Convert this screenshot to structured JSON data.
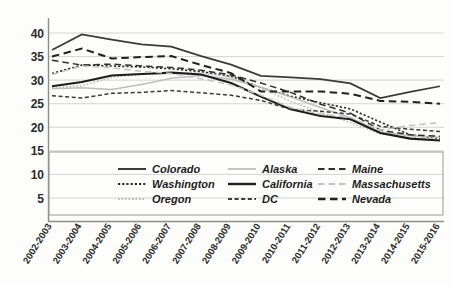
{
  "chart_data": {
    "type": "line",
    "title": "",
    "xlabel": "",
    "ylabel": "",
    "ylim": [
      0,
      42
    ],
    "yticks": [
      5,
      10,
      15,
      20,
      25,
      30,
      35,
      40
    ],
    "grid": true,
    "legend_position": "bottom-inside",
    "categories": [
      "2002-2003",
      "2003-2004",
      "2004-2005",
      "2005-2006",
      "2006-2007",
      "2007-2008",
      "2008-2009",
      "2009-2010",
      "2010-2011",
      "2011-2012",
      "2012-2013",
      "2013-2014",
      "2014-2015",
      "2015-2016"
    ],
    "series": [
      {
        "name": "Colorado",
        "style": "solid",
        "color": "#3a3a3a",
        "width": 1.7,
        "values": [
          36.4,
          39.7,
          38.6,
          37.6,
          37.1,
          35.1,
          33.3,
          30.9,
          30.6,
          30.2,
          29.3,
          26.2,
          27.5,
          28.7
        ]
      },
      {
        "name": "Washington",
        "style": "dotted",
        "color": "#2b2b2b",
        "width": 1.6,
        "values": [
          31.4,
          33.2,
          33.0,
          32.8,
          32.4,
          31.8,
          30.8,
          28.4,
          26.6,
          25.2,
          23.9,
          21.1,
          18.4,
          17.6
        ]
      },
      {
        "name": "Oregon",
        "style": "fine-dotted",
        "color": "#b9b9b9",
        "width": 1.5,
        "values": [
          28.4,
          28.8,
          30.6,
          31.2,
          31.4,
          31.6,
          30.6,
          28.3,
          25.5,
          23.1,
          21.0,
          18.6,
          17.8,
          17.4
        ]
      },
      {
        "name": "Alaska",
        "style": "solid",
        "color": "#bdbdbd",
        "width": 1.5,
        "values": [
          28.2,
          28.4,
          28.0,
          29.1,
          30.4,
          31.0,
          30.2,
          28.5,
          26.4,
          24.2,
          22.0,
          19.0,
          18.2,
          17.9
        ]
      },
      {
        "name": "California",
        "style": "solid",
        "color": "#1c1c1c",
        "width": 2.1,
        "values": [
          28.7,
          29.6,
          31.0,
          31.3,
          31.6,
          31.2,
          29.4,
          26.5,
          23.8,
          22.4,
          21.7,
          18.8,
          17.6,
          17.2
        ]
      },
      {
        "name": "DC",
        "style": "dashed-short",
        "color": "#3a3a3a",
        "width": 1.5,
        "values": [
          26.7,
          26.2,
          27.2,
          27.4,
          27.8,
          27.3,
          26.8,
          25.7,
          23.8,
          23.4,
          22.8,
          20.2,
          19.6,
          19.1
        ]
      },
      {
        "name": "Maine",
        "style": "dashed-long",
        "color": "#2f2f2f",
        "width": 1.5,
        "values": [
          34.2,
          33.2,
          33.4,
          33.0,
          32.7,
          32.1,
          31.1,
          29.4,
          27.4,
          24.9,
          23.0,
          19.4,
          18.4,
          18.1
        ]
      },
      {
        "name": "Massachusetts",
        "style": "dashed-long",
        "color": "#c2c2c2",
        "width": 1.5,
        "values": [
          31.2,
          33.0,
          32.6,
          31.9,
          31.4,
          30.3,
          29.0,
          26.8,
          24.2,
          22.8,
          22.1,
          19.4,
          20.4,
          21.0
        ]
      },
      {
        "name": "Nevada",
        "style": "dashed-bold",
        "color": "#1f1f1f",
        "width": 2.0,
        "values": [
          35.0,
          36.7,
          34.6,
          34.9,
          35.1,
          33.2,
          31.5,
          27.6,
          27.6,
          27.6,
          27.1,
          25.6,
          25.4,
          25.0
        ]
      }
    ]
  },
  "legend": {
    "columns": [
      [
        "Colorado",
        "Washington",
        "Oregon"
      ],
      [
        "Alaska",
        "California",
        "DC"
      ],
      [
        "Maine",
        "Massachusetts",
        "Nevada"
      ]
    ]
  }
}
